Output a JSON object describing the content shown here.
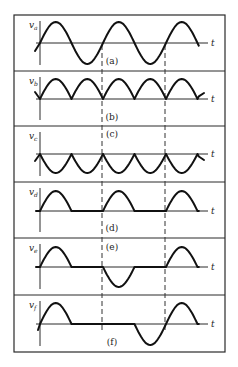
{
  "figure": {
    "frame": {
      "x": 14,
      "y": 15,
      "w": 211,
      "h": 337
    },
    "time_axis_label": "t",
    "axis_x": 40,
    "t_end": 208,
    "period_px": 63,
    "wave_end_x": 200,
    "dashed_lines_x": [
      102,
      165
    ],
    "dashed_span": {
      "y1": 45,
      "y2": 330
    },
    "dividers_y": [
      71,
      126,
      182,
      238,
      295
    ],
    "panels": [
      {
        "id": "a",
        "caption": "(a)",
        "ylabel": "v",
        "ysub": "a",
        "baseline": 43,
        "amp": 21,
        "caption_x": 102,
        "caption_y": 64,
        "waveform": "sine"
      },
      {
        "id": "b",
        "caption": "(b)",
        "ylabel": "v",
        "ysub": "b",
        "baseline": 99,
        "amp": 20,
        "caption_x": 102,
        "caption_y": 120,
        "waveform": "full-wave rectified (positive)"
      },
      {
        "id": "c",
        "caption": "(c)",
        "ylabel": "v",
        "ysub": "c",
        "baseline": 154,
        "amp": 19,
        "caption_x": 102,
        "caption_y": 137,
        "waveform": "full-wave rectified (negative)"
      },
      {
        "id": "d",
        "caption": "(d)",
        "ylabel": "v",
        "ysub": "d",
        "baseline": 211,
        "amp": 20,
        "caption_x": 102,
        "caption_y": 231,
        "waveform": "half-wave rectified (positive)"
      },
      {
        "id": "e",
        "caption": "(e)",
        "ylabel": "v",
        "ysub": "e",
        "baseline": 267,
        "amp": 20,
        "caption_x": 102,
        "caption_y": 250,
        "waveform": "pos half, zero, neg half, zero, pos half"
      },
      {
        "id": "f",
        "caption": "(f)",
        "ylabel": "v",
        "ysub": "f",
        "baseline": 324,
        "amp": 21,
        "caption_x": 102,
        "caption_y": 345,
        "waveform": "pos half, zero, zero, neg half, pos half"
      }
    ]
  }
}
